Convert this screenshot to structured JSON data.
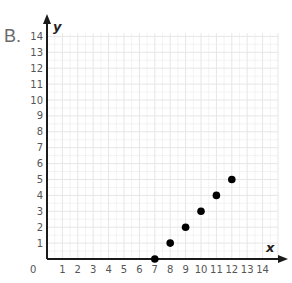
{
  "panel_label": "B.",
  "chart_data": {
    "type": "scatter",
    "title": "",
    "xlabel": "x",
    "ylabel": "y",
    "xlim": [
      0,
      14
    ],
    "ylim": [
      0,
      14
    ],
    "grid": true,
    "legend": null,
    "origin_label": "0",
    "x_ticks": [
      1,
      2,
      3,
      4,
      5,
      6,
      7,
      8,
      9,
      10,
      11,
      12,
      13,
      14
    ],
    "y_ticks": [
      1,
      2,
      3,
      4,
      5,
      6,
      7,
      8,
      9,
      10,
      11,
      12,
      13,
      14
    ],
    "points": [
      {
        "x": 7,
        "y": 0
      },
      {
        "x": 8,
        "y": 1
      },
      {
        "x": 9,
        "y": 2
      },
      {
        "x": 10,
        "y": 3
      },
      {
        "x": 11,
        "y": 4
      },
      {
        "x": 12,
        "y": 5
      }
    ],
    "colors": {
      "grid": "#e6e6e6",
      "axis": "#1a1a1a",
      "point": "#000000"
    }
  }
}
